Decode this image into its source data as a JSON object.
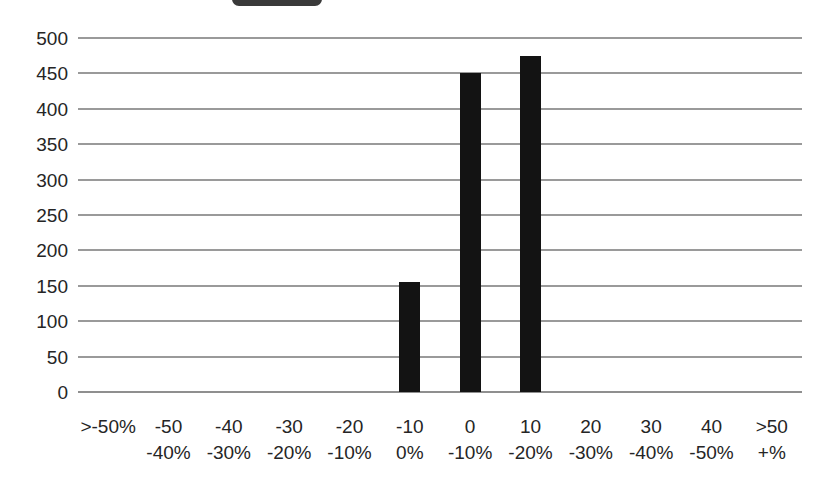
{
  "legend": {
    "swatch_color": "#3a3a3a",
    "label": ""
  },
  "chart_data": {
    "type": "bar",
    "title": "",
    "subtitle": "",
    "xlabel": "",
    "ylabel": "",
    "ylim": [
      0,
      500
    ],
    "ytick_step": 50,
    "grid": true,
    "legend_position": "top",
    "bar_color": "#131313",
    "gridline_color": "#9a9a9a",
    "categories": [
      ">-50%",
      "-50 -40%",
      "-40 -30%",
      "-30 -20%",
      "-20 -10%",
      "-10 0%",
      "0 -10%",
      "10 -20%",
      "20 -30%",
      "30 -40%",
      "40 -50%",
      ">50 +%"
    ],
    "category_lines": [
      {
        "line1": ">-50%",
        "line2": ""
      },
      {
        "line1": "-50",
        "line2": "-40%"
      },
      {
        "line1": "-40",
        "line2": "-30%"
      },
      {
        "line1": "-30",
        "line2": "-20%"
      },
      {
        "line1": "-20",
        "line2": "-10%"
      },
      {
        "line1": "-10",
        "line2": "0%"
      },
      {
        "line1": "0",
        "line2": "-10%"
      },
      {
        "line1": "10",
        "line2": "-20%"
      },
      {
        "line1": "20",
        "line2": "-30%"
      },
      {
        "line1": "30",
        "line2": "-40%"
      },
      {
        "line1": "40",
        "line2": "-50%"
      },
      {
        "line1": ">50",
        "line2": "+%"
      }
    ],
    "values": [
      0,
      0,
      0,
      0,
      0,
      155,
      450,
      475,
      0,
      0,
      0,
      0
    ],
    "yticks": [
      500,
      450,
      400,
      350,
      300,
      250,
      200,
      150,
      100,
      50,
      0
    ],
    "ytick_labels": [
      "500",
      "450",
      "400",
      "350",
      "300",
      "250",
      "200",
      "150",
      "100",
      "50",
      "0"
    ]
  }
}
